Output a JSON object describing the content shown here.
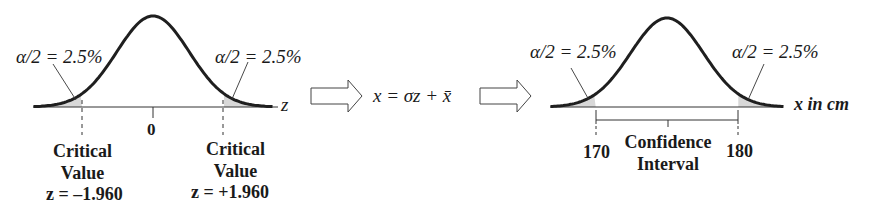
{
  "colors": {
    "curve": "#1f1f1f",
    "axis": "#333333",
    "tail_fill": "#d8d8d8",
    "text": "#1a1a1a",
    "background": "#ffffff"
  },
  "left_panel": {
    "alpha_left": "α/2 = 2.5%",
    "alpha_right": "α/2 = 2.5%",
    "axis_label": "z",
    "center_tick": "0",
    "crit_left": {
      "line1": "Critical",
      "line2": "Value",
      "line3": "z = –1.960"
    },
    "crit_right": {
      "line1": "Critical",
      "line2": "Value",
      "line3": "z = +1.960"
    }
  },
  "transform": {
    "formula": "x = σz + x̄",
    "arrow_icons": [
      "right-arrow-icon",
      "right-arrow-icon"
    ]
  },
  "right_panel": {
    "alpha_left": "α/2 = 2.5%",
    "alpha_right": "α/2 = 2.5%",
    "axis_label": "x in cm",
    "lower_bound": "170",
    "upper_bound": "180",
    "interval_label_line1": "Confidence",
    "interval_label_line2": "Interval"
  },
  "chart_data": [
    {
      "type": "line",
      "title": "Standard normal distribution (z)",
      "xlabel": "z",
      "ylabel": "",
      "distribution": "normal",
      "mean": 0,
      "sd": 1,
      "x_range": [
        -3.5,
        3.5
      ],
      "critical_values": [
        -1.96,
        1.96
      ],
      "tail_areas": [
        0.025,
        0.025
      ],
      "annotations": [
        "α/2 = 2.5%",
        "α/2 = 2.5%",
        "Critical Value z = –1.960",
        "Critical Value z = +1.960",
        "0"
      ],
      "grid": false
    },
    {
      "type": "line",
      "title": "Sampling distribution in cm (x)",
      "xlabel": "x in cm",
      "ylabel": "",
      "distribution": "normal",
      "transform": "x = σz + x̄",
      "confidence_interval": [
        170,
        180
      ],
      "tail_areas": [
        0.025,
        0.025
      ],
      "annotations": [
        "α/2 = 2.5%",
        "α/2 = 2.5%",
        "170",
        "180",
        "Confidence Interval"
      ],
      "grid": false
    }
  ]
}
